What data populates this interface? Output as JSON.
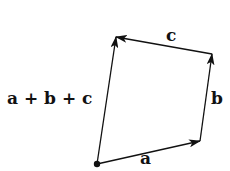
{
  "diagram": {
    "title": "",
    "labels": {
      "a": "a",
      "b": "b",
      "c": "c",
      "sum": "a + b + c"
    },
    "vectors": [
      {
        "name": "a",
        "from": [
          97,
          164
        ],
        "to": [
          200,
          141
        ]
      },
      {
        "name": "b",
        "from": [
          200,
          141
        ],
        "to": [
          212,
          54
        ]
      },
      {
        "name": "c",
        "from": [
          212,
          54
        ],
        "to": [
          116,
          37
        ]
      },
      {
        "name": "a + b + c",
        "from": [
          97,
          164
        ],
        "to": [
          116,
          37
        ]
      }
    ],
    "origin": [
      97,
      164
    ],
    "colors": {
      "stroke": "#111111",
      "background": "#ffffff"
    }
  }
}
